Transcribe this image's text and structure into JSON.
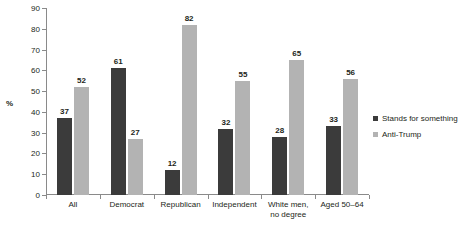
{
  "chart_data": {
    "type": "bar",
    "title": "",
    "xlabel": "",
    "ylabel": "%",
    "ylim": [
      0,
      90
    ],
    "yticks": [
      0,
      10,
      20,
      30,
      40,
      50,
      60,
      70,
      80,
      90
    ],
    "grid": false,
    "legend_position": "right",
    "categories": [
      "All",
      "Democrat",
      "Republican",
      "Independent",
      "White men,\nno degree",
      "Aged 50–64"
    ],
    "series": [
      {
        "name": "Stands for something",
        "color": "#3b3b3b",
        "values": [
          37,
          61,
          12,
          32,
          28,
          33
        ]
      },
      {
        "name": "Anti-Trump",
        "color": "#b3b3b3",
        "values": [
          52,
          27,
          82,
          55,
          65,
          56
        ]
      }
    ]
  },
  "legend": {
    "items": [
      {
        "label": "Stands for something"
      },
      {
        "label": "Anti-Trump"
      }
    ]
  }
}
